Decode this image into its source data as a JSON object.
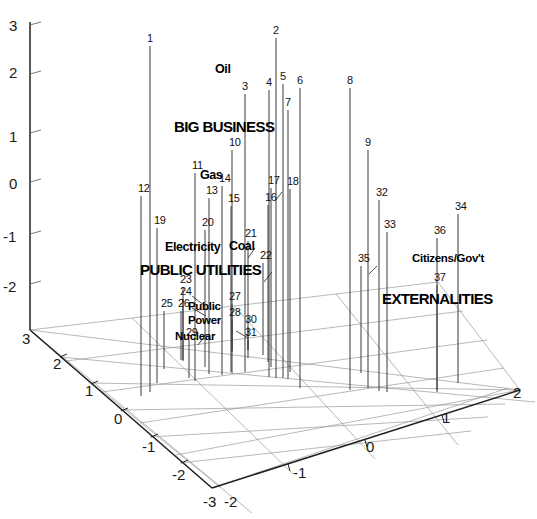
{
  "chart_data": {
    "type": "scatter",
    "title": "",
    "subtitle": "",
    "xlabel": "",
    "ylabel": "",
    "zlabel": "",
    "projection": "3d-stem",
    "grid": true,
    "legend": "none",
    "axes": {
      "x": {
        "ticks": [
          "-2",
          "-1",
          "0",
          "1",
          "2"
        ],
        "range": [
          -2,
          2
        ],
        "position": "bottom-right-edge"
      },
      "y": {
        "ticks": [
          "3",
          "2",
          "1",
          "0",
          "-1",
          "-2",
          "-3"
        ],
        "range": [
          -3,
          3
        ],
        "position": "bottom-left-edge"
      },
      "z": {
        "ticks": [
          "3",
          "2",
          "1",
          "0",
          "-1",
          "-2",
          "-3"
        ],
        "range": [
          -3,
          3
        ],
        "position": "left-vertical"
      }
    },
    "annotations": [
      {
        "text": "Oil",
        "style": "minor"
      },
      {
        "text": "BIG BUSINESS",
        "style": "major"
      },
      {
        "text": "Gas",
        "style": "minor"
      },
      {
        "text": "Electricity",
        "style": "minor"
      },
      {
        "text": "Coal",
        "style": "minor"
      },
      {
        "text": "PUBLIC UTILITIES",
        "style": "major"
      },
      {
        "text": "Public",
        "style": "small"
      },
      {
        "text": "Power",
        "style": "small"
      },
      {
        "text": "Nuclear",
        "style": "small"
      },
      {
        "text": "Citizens/Gov't",
        "style": "small"
      },
      {
        "text": "EXTERNALITIES",
        "style": "major"
      }
    ],
    "point_labels": [
      "1",
      "2",
      "3",
      "4",
      "5",
      "6",
      "7",
      "8",
      "9",
      "10",
      "11",
      "12",
      "13",
      "14",
      "15",
      "16",
      "17",
      "18",
      "19",
      "20",
      "21",
      "22",
      "23",
      "24",
      "25",
      "26",
      "27",
      "28",
      "29",
      "30",
      "31",
      "32",
      "33",
      "34",
      "35",
      "36",
      "37"
    ],
    "points": [
      {
        "id": "1",
        "top_px": 46,
        "base_px": 392,
        "x_px": 150
      },
      {
        "id": "2",
        "top_px": 38,
        "base_px": 378,
        "x_px": 276
      },
      {
        "id": "3",
        "top_px": 94,
        "base_px": 372,
        "x_px": 245
      },
      {
        "id": "4",
        "top_px": 90,
        "base_px": 377,
        "x_px": 269
      },
      {
        "id": "5",
        "top_px": 84,
        "base_px": 378,
        "x_px": 283
      },
      {
        "id": "6",
        "top_px": 88,
        "base_px": 388,
        "x_px": 300
      },
      {
        "id": "7",
        "top_px": 110,
        "base_px": 379,
        "x_px": 288
      },
      {
        "id": "8",
        "top_px": 88,
        "base_px": 390,
        "x_px": 350
      },
      {
        "id": "9",
        "top_px": 150,
        "base_px": 388,
        "x_px": 368
      },
      {
        "id": "10",
        "top_px": 150,
        "base_px": 373,
        "x_px": 232
      },
      {
        "id": "11",
        "top_px": 173,
        "base_px": 381,
        "x_px": 195
      },
      {
        "id": "12",
        "top_px": 196,
        "base_px": 396,
        "x_px": 141
      },
      {
        "id": "13",
        "top_px": 198,
        "base_px": 374,
        "x_px": 209
      },
      {
        "id": "14",
        "top_px": 186,
        "base_px": 375,
        "x_px": 222
      },
      {
        "id": "15",
        "top_px": 206,
        "base_px": 372,
        "x_px": 231
      },
      {
        "id": "16",
        "top_px": 205,
        "base_px": 362,
        "x_px": 268
      },
      {
        "id": "17",
        "top_px": 188,
        "base_px": 367,
        "x_px": 271
      },
      {
        "id": "18",
        "top_px": 189,
        "base_px": 372,
        "x_px": 290
      },
      {
        "id": "19",
        "top_px": 228,
        "base_px": 383,
        "x_px": 157
      },
      {
        "id": "20",
        "top_px": 230,
        "base_px": 367,
        "x_px": 205
      },
      {
        "id": "21",
        "top_px": 241,
        "base_px": 358,
        "x_px": 248
      },
      {
        "id": "22",
        "top_px": 263,
        "base_px": 355,
        "x_px": 263
      },
      {
        "id": "23",
        "top_px": 287,
        "base_px": 361,
        "x_px": 183
      },
      {
        "id": "24",
        "top_px": 299,
        "base_px": 360,
        "x_px": 183
      },
      {
        "id": "25",
        "top_px": 311,
        "base_px": 369,
        "x_px": 164
      },
      {
        "id": "26",
        "top_px": 311,
        "base_px": 360,
        "x_px": 181
      },
      {
        "id": "27",
        "top_px": 304,
        "base_px": 350,
        "x_px": 232
      },
      {
        "id": "28",
        "top_px": 320,
        "base_px": 352,
        "x_px": 232
      },
      {
        "id": "29",
        "top_px": 340,
        "base_px": 378,
        "x_px": 189
      },
      {
        "id": "30",
        "top_px": 327,
        "base_px": 350,
        "x_px": 248
      },
      {
        "id": "31",
        "top_px": 340,
        "base_px": 350,
        "x_px": 248
      },
      {
        "id": "32",
        "top_px": 200,
        "base_px": 391,
        "x_px": 379
      },
      {
        "id": "33",
        "top_px": 232,
        "base_px": 392,
        "x_px": 387
      },
      {
        "id": "34",
        "top_px": 214,
        "base_px": 383,
        "x_px": 458
      },
      {
        "id": "35",
        "top_px": 266,
        "base_px": 373,
        "x_px": 361
      },
      {
        "id": "36",
        "top_px": 238,
        "base_px": 390,
        "x_px": 437
      },
      {
        "id": "37",
        "top_px": 285,
        "base_px": 392,
        "x_px": 437
      }
    ]
  },
  "axis_labels": {
    "z": [
      {
        "text": "3",
        "x": 9,
        "y": 17
      },
      {
        "text": "2",
        "x": 9,
        "y": 64
      },
      {
        "text": "1",
        "x": 9,
        "y": 128
      },
      {
        "text": "0",
        "x": 9,
        "y": 175
      },
      {
        "text": "-1",
        "x": 3,
        "y": 228
      },
      {
        "text": "-2",
        "x": 3,
        "y": 278
      },
      {
        "text": "3",
        "x": 22,
        "y": 330
      }
    ],
    "y": [
      {
        "text": "2",
        "x": 53,
        "y": 355
      },
      {
        "text": "1",
        "x": 85,
        "y": 382
      },
      {
        "text": "0",
        "x": 114,
        "y": 410
      },
      {
        "text": "-1",
        "x": 142,
        "y": 438
      },
      {
        "text": "-2",
        "x": 172,
        "y": 466
      },
      {
        "text": "-3",
        "x": 203,
        "y": 493
      }
    ],
    "x": [
      {
        "text": "-2",
        "x": 224,
        "y": 493
      },
      {
        "text": "-1",
        "x": 293,
        "y": 464
      },
      {
        "text": "0",
        "x": 366,
        "y": 438
      },
      {
        "text": "1",
        "x": 442,
        "y": 409
      },
      {
        "text": "2",
        "x": 513,
        "y": 384
      }
    ]
  },
  "cluster_labels": [
    {
      "key": "oil",
      "text": "Oil",
      "x": 215,
      "y": 62,
      "style": "lbl-minor"
    },
    {
      "key": "big-business",
      "text": "BIG BUSINESS",
      "x": 174,
      "y": 118,
      "style": "lbl-major"
    },
    {
      "key": "gas",
      "text": "Gas",
      "x": 200,
      "y": 168,
      "style": "lbl-minor"
    },
    {
      "key": "electricity",
      "text": "Electricity",
      "x": 165,
      "y": 240,
      "style": "lbl-minor"
    },
    {
      "key": "coal",
      "text": "Coal",
      "x": 229,
      "y": 239,
      "style": "lbl-minor"
    },
    {
      "key": "public-utilities",
      "text": "PUBLIC UTILITIES",
      "x": 140,
      "y": 261,
      "style": "lbl-major"
    },
    {
      "key": "public",
      "text": "Public",
      "x": 188,
      "y": 300,
      "style": "lbl-small"
    },
    {
      "key": "power",
      "text": "Power",
      "x": 188,
      "y": 314,
      "style": "lbl-small"
    },
    {
      "key": "nuclear",
      "text": "Nuclear",
      "x": 175,
      "y": 330,
      "style": "lbl-small"
    },
    {
      "key": "citizens-govt",
      "text": "Citizens/Gov't",
      "x": 412,
      "y": 252,
      "style": "lbl-small"
    },
    {
      "key": "externalities",
      "text": "EXTERNALITIES",
      "x": 382,
      "y": 290,
      "style": "lbl-major"
    }
  ],
  "colors": {
    "stem": "#3a3a3a",
    "grid": "#9a9a9a",
    "axis": "#202020",
    "text": "#000000",
    "background": "#ffffff"
  }
}
